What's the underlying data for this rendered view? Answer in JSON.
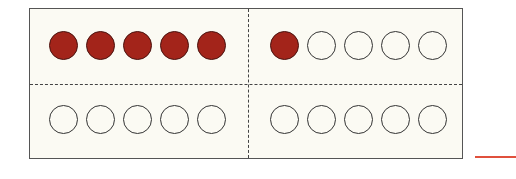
{
  "ten_frame": {
    "quadrants": [
      {
        "position": "top-left",
        "filled": 5,
        "total": 5
      },
      {
        "position": "top-right",
        "filled": 1,
        "total": 5
      },
      {
        "position": "bottom-left",
        "filled": 0,
        "total": 5
      },
      {
        "position": "bottom-right",
        "filled": 0,
        "total": 5
      }
    ],
    "total_filled": 6,
    "colors": {
      "filled": "#a3241a",
      "empty": "#fbfaf3",
      "answer_line": "#e0503c"
    }
  },
  "answer_blank": ""
}
